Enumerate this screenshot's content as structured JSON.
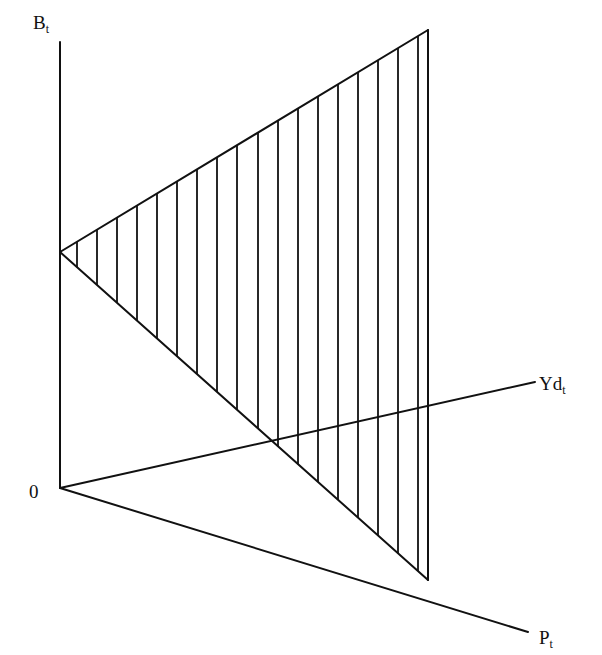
{
  "diagram": {
    "axes": {
      "vertical": {
        "label": "B",
        "subscript": "t"
      },
      "ray_upper": {
        "label": "Yd",
        "subscript": "t"
      },
      "ray_lower": {
        "label": "P",
        "subscript": "t"
      },
      "origin_label": "0"
    },
    "geometry": {
      "origin": [
        60,
        488
      ],
      "vertical_axis_top": [
        60,
        42
      ],
      "triangle_left_vertex": [
        60,
        252
      ],
      "triangle_apex": [
        428,
        30
      ],
      "triangle_bottom_vertex": [
        428,
        580
      ],
      "yd_ray_end": [
        535,
        382
      ],
      "p_ray_end": [
        528,
        632
      ],
      "hatch_x": [
        77,
        97,
        117,
        137,
        157,
        177,
        197,
        217,
        237,
        258,
        278,
        298,
        318,
        338,
        358,
        378,
        398,
        418
      ]
    },
    "colors": {
      "line": "#111111",
      "background": "#ffffff"
    }
  }
}
